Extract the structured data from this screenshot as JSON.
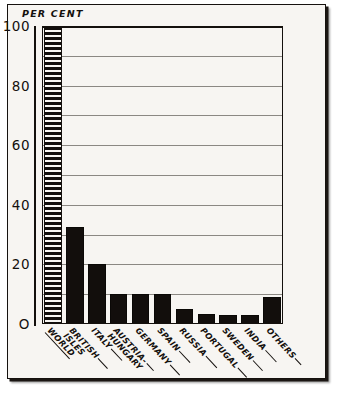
{
  "figure": {
    "axis_title": "PER CENT",
    "frame_color": "#14100d",
    "background_color": "#f7f5f2",
    "bar_color": "#120e0c",
    "gridline_color": "#8b8883"
  },
  "chart_data": {
    "type": "bar",
    "title": "PER CENT",
    "xlabel": "",
    "ylabel": "PER CENT",
    "ylim": [
      0,
      100
    ],
    "yticks": [
      0,
      20,
      40,
      60,
      80,
      100
    ],
    "ytick_labels": [
      "O",
      "20",
      "40",
      "60",
      "80",
      "100"
    ],
    "gridlines": [
      10,
      20,
      30,
      40,
      50,
      60,
      70,
      80,
      90,
      100
    ],
    "grid": true,
    "legend": "none",
    "categories": [
      "WORLD",
      "BRITISH ISLES",
      "ITALY",
      "AUSTRIA-HUNGARY",
      "GERMANY",
      "SPAIN",
      "RUSSIA",
      "PORTUGAL",
      "SWEDEN",
      "INDIA",
      "OTHERS"
    ],
    "values": [
      100,
      32.5,
      20,
      10,
      10,
      10,
      5,
      3.5,
      3,
      3,
      9
    ],
    "bar_styles": [
      "hatched",
      "solid",
      "solid",
      "solid",
      "solid",
      "solid",
      "solid",
      "solid",
      "solid",
      "solid",
      "solid"
    ]
  },
  "xlabels": [
    {
      "line1": "WORLD",
      "line2": "",
      "underline": true,
      "leader": 0
    },
    {
      "line1": "BRITISH",
      "line2": "ISLES",
      "underline": false,
      "leader": 14
    },
    {
      "line1": "ITALY",
      "line2": "",
      "underline": false,
      "leader": 16
    },
    {
      "line1": "AUSTRIA-",
      "line2": "HUNGARY",
      "underline": false,
      "leader": 10
    },
    {
      "line1": "GERMANY",
      "line2": "",
      "underline": false,
      "leader": 14
    },
    {
      "line1": "SPAIN",
      "line2": "",
      "underline": false,
      "leader": 16
    },
    {
      "line1": "RUSSIA",
      "line2": "",
      "underline": false,
      "leader": 16
    },
    {
      "line1": "PORTUGAL",
      "line2": "",
      "underline": false,
      "leader": 13
    },
    {
      "line1": "SWEDEN",
      "line2": "",
      "underline": false,
      "leader": 14
    },
    {
      "line1": "INDIA",
      "line2": "",
      "underline": false,
      "leader": 16
    },
    {
      "line1": "OTHERS",
      "line2": "",
      "underline": false,
      "leader": 9
    }
  ]
}
